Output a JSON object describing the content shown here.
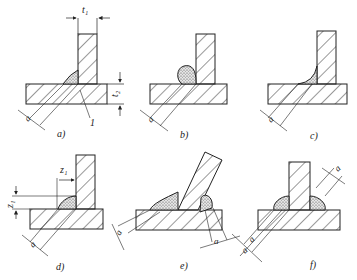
{
  "diagram": {
    "type": "welded T-joint fillet weld variants",
    "panels": [
      {
        "id": "a",
        "caption": "a)",
        "dims": [
          "t1",
          "t2",
          "a"
        ],
        "callout": "1",
        "weld": "flat fillet"
      },
      {
        "id": "b",
        "caption": "b)",
        "dims": [
          "a"
        ],
        "weld": "convex fillet"
      },
      {
        "id": "c",
        "caption": "c)",
        "dims": [
          "a"
        ],
        "weld": "concave fillet"
      },
      {
        "id": "d",
        "caption": "d)",
        "dims": [
          "z1",
          "z1",
          "a"
        ],
        "weld": "fillet with leg lengths"
      },
      {
        "id": "e",
        "caption": "e)",
        "dims": [
          "a",
          "a"
        ],
        "weld": "inclined plate, two fillets"
      },
      {
        "id": "f",
        "caption": "f)",
        "dims": [
          "a",
          "a",
          "a"
        ],
        "weld": "double fillet"
      }
    ]
  },
  "labels": {
    "t1": "t₁",
    "t2": "t₂",
    "z1": "z₁",
    "a": "a",
    "callout": "1",
    "cap_a": "a)",
    "cap_b": "b)",
    "cap_c": "c)",
    "cap_d": "d)",
    "cap_e": "e)",
    "cap_f": "f)"
  },
  "colors": {
    "line": "#222222",
    "hatch": "#333333",
    "weld": "#bbbbbb",
    "bg": "#ffffff"
  }
}
